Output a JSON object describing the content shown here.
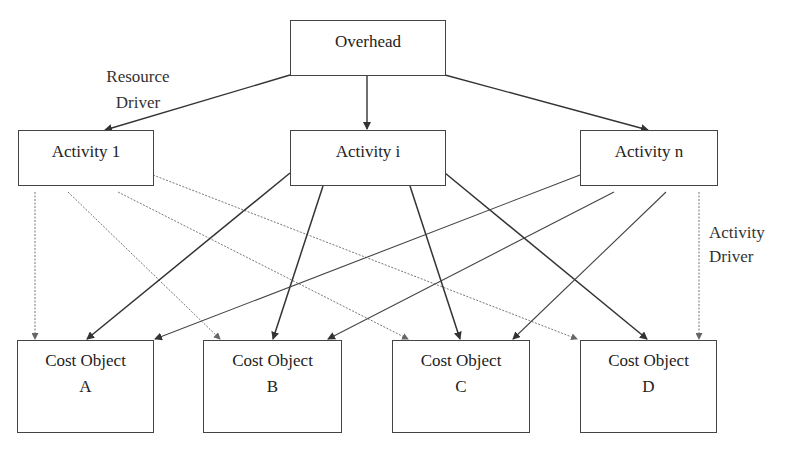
{
  "diagram": {
    "nodes": {
      "overhead": {
        "label": "Overhead"
      },
      "activities": [
        {
          "id": "activity-1",
          "label": "Activity 1"
        },
        {
          "id": "activity-i",
          "label": "Activity i"
        },
        {
          "id": "activity-n",
          "label": "Activity n"
        }
      ],
      "cost_objects": [
        {
          "id": "cost-object-a",
          "line1": "Cost Object",
          "line2": "A"
        },
        {
          "id": "cost-object-b",
          "line1": "Cost Object",
          "line2": "B"
        },
        {
          "id": "cost-object-c",
          "line1": "Cost Object",
          "line2": "C"
        },
        {
          "id": "cost-object-d",
          "line1": "Cost Object",
          "line2": "D"
        }
      ]
    },
    "annotations": {
      "resource_driver": {
        "line1": "Resource",
        "line2": "Driver"
      },
      "activity_driver": {
        "line1": "Activity",
        "line2": "Driver"
      }
    },
    "edges": [
      {
        "from": "Overhead",
        "to": "Activity 1",
        "style": "solid"
      },
      {
        "from": "Overhead",
        "to": "Activity i",
        "style": "solid"
      },
      {
        "from": "Overhead",
        "to": "Activity n",
        "style": "solid"
      },
      {
        "from": "Activity 1",
        "to": "Cost Object A",
        "style": "dotted"
      },
      {
        "from": "Activity 1",
        "to": "Cost Object B",
        "style": "dotted"
      },
      {
        "from": "Activity 1",
        "to": "Cost Object C",
        "style": "dotted"
      },
      {
        "from": "Activity 1",
        "to": "Cost Object D",
        "style": "dotted"
      },
      {
        "from": "Activity i",
        "to": "Cost Object A",
        "style": "solid"
      },
      {
        "from": "Activity i",
        "to": "Cost Object B",
        "style": "solid"
      },
      {
        "from": "Activity i",
        "to": "Cost Object C",
        "style": "solid"
      },
      {
        "from": "Activity i",
        "to": "Cost Object D",
        "style": "solid"
      },
      {
        "from": "Activity n",
        "to": "Cost Object A",
        "style": "thin"
      },
      {
        "from": "Activity n",
        "to": "Cost Object B",
        "style": "thin"
      },
      {
        "from": "Activity n",
        "to": "Cost Object C",
        "style": "thin"
      },
      {
        "from": "Activity n",
        "to": "Cost Object D",
        "style": "dotted"
      }
    ],
    "colors": {
      "line": "#333333",
      "dotted_line": "#777777",
      "box_border": "#444444"
    }
  }
}
